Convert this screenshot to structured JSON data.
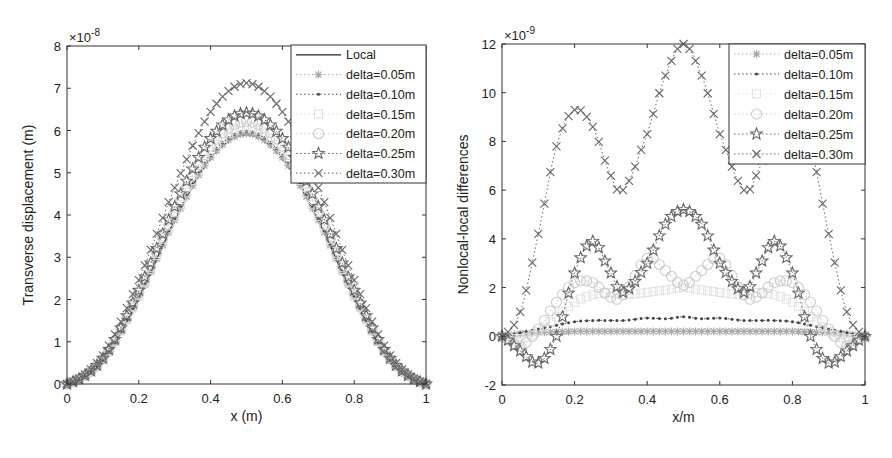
{
  "chart_data": [
    {
      "type": "line",
      "title": "",
      "xlabel": "x (m)",
      "ylabel": "Transverse displacement (m)",
      "y_multiplier": "×10",
      "y_exponent": "-8",
      "xlim": [
        0,
        1
      ],
      "ylim": [
        0,
        8
      ],
      "xticks": [
        "0",
        "0.2",
        "0.4",
        "0.6",
        "0.8",
        "1"
      ],
      "yticks": [
        "0",
        "1",
        "2",
        "3",
        "4",
        "5",
        "6",
        "7",
        "8"
      ],
      "grid": false,
      "legend_position": "upper right",
      "x_note": "curves are sin^2-shaped, zero at ends, peak at x=0.5; values given at peak",
      "x": [
        0,
        0.1,
        0.2,
        0.3,
        0.4,
        0.5,
        0.6,
        0.7,
        0.8,
        0.9,
        1.0
      ],
      "series": [
        {
          "name": "Local",
          "marker": "none",
          "line": "solid",
          "color": "#222222",
          "peak": 5.9,
          "values": [
            0,
            0.56,
            2.04,
            3.86,
            5.34,
            5.9,
            5.34,
            3.86,
            2.04,
            0.56,
            0
          ]
        },
        {
          "name": "delta=0.05m",
          "marker": "asterisk",
          "line": "dotted",
          "color": "#aaaaaa",
          "peak": 5.93,
          "values": [
            0,
            0.57,
            2.05,
            3.88,
            5.36,
            5.93,
            5.36,
            3.88,
            2.05,
            0.57,
            0
          ]
        },
        {
          "name": "delta=0.10m",
          "marker": "dot",
          "line": "dotted",
          "color": "#444444",
          "peak": 5.98,
          "values": [
            0,
            0.57,
            2.07,
            3.91,
            5.41,
            5.98,
            5.41,
            3.91,
            2.07,
            0.57,
            0
          ]
        },
        {
          "name": "delta=0.15m",
          "marker": "square",
          "line": "dotted",
          "color": "#dddddd",
          "peak": 6.08,
          "values": [
            0,
            0.58,
            2.1,
            3.97,
            5.5,
            6.08,
            5.5,
            3.97,
            2.1,
            0.58,
            0
          ]
        },
        {
          "name": "delta=0.20m",
          "marker": "circle",
          "line": "dotted",
          "color": "#cccccc",
          "peak": 6.22,
          "values": [
            0,
            0.59,
            2.15,
            4.07,
            5.63,
            6.22,
            5.63,
            4.07,
            2.15,
            0.59,
            0
          ]
        },
        {
          "name": "delta=0.25m",
          "marker": "star",
          "line": "dotted",
          "color": "#666666",
          "peak": 6.42,
          "values": [
            0,
            0.61,
            2.22,
            4.2,
            5.81,
            6.42,
            5.81,
            4.2,
            2.22,
            0.61,
            0
          ]
        },
        {
          "name": "delta=0.30m",
          "marker": "x",
          "line": "dotted",
          "color": "#666666",
          "peak": 7.12,
          "values": [
            0,
            0.68,
            2.46,
            4.65,
            6.44,
            7.12,
            6.44,
            4.65,
            2.46,
            0.68,
            0
          ]
        }
      ]
    },
    {
      "type": "line",
      "title": "",
      "xlabel": "x/m",
      "ylabel": "Nonlocal-local differences",
      "y_multiplier": "×10",
      "y_exponent": "-9",
      "xlim": [
        0,
        1
      ],
      "ylim": [
        -2,
        12
      ],
      "xticks": [
        "0",
        "0.2",
        "0.4",
        "0.6",
        "0.8",
        "1"
      ],
      "yticks": [
        "-2",
        "0",
        "2",
        "4",
        "6",
        "8",
        "10",
        "12"
      ],
      "grid": false,
      "legend_position": "upper right",
      "x": [
        0,
        0.05,
        0.1,
        0.15,
        0.2,
        0.25,
        0.3,
        0.333,
        0.4,
        0.45,
        0.5,
        0.55,
        0.6,
        0.667,
        0.7,
        0.75,
        0.8,
        0.85,
        0.9,
        0.95,
        1.0
      ],
      "series": [
        {
          "name": "delta=0.05m",
          "marker": "asterisk",
          "line": "dotted",
          "color": "#aaaaaa",
          "values": [
            0,
            0.1,
            0.15,
            0.18,
            0.2,
            0.2,
            0.2,
            0.2,
            0.2,
            0.2,
            0.2,
            0.2,
            0.2,
            0.2,
            0.2,
            0.2,
            0.2,
            0.18,
            0.15,
            0.1,
            0
          ]
        },
        {
          "name": "delta=0.10m",
          "marker": "dot",
          "line": "dotted",
          "color": "#444444",
          "values": [
            0,
            0.15,
            0.3,
            0.45,
            0.6,
            0.65,
            0.65,
            0.65,
            0.75,
            0.72,
            0.8,
            0.72,
            0.75,
            0.65,
            0.65,
            0.65,
            0.6,
            0.45,
            0.3,
            0.15,
            0
          ]
        },
        {
          "name": "delta=0.15m",
          "marker": "square",
          "line": "dotted",
          "color": "#e2e2e2",
          "values": [
            0,
            -0.1,
            0.2,
            0.8,
            1.4,
            1.7,
            1.8,
            1.7,
            1.8,
            1.9,
            2.0,
            1.9,
            1.8,
            1.7,
            1.8,
            1.7,
            1.4,
            0.8,
            0.2,
            -0.1,
            0
          ]
        },
        {
          "name": "delta=0.20m",
          "marker": "circle",
          "line": "dotted",
          "color": "#cccccc",
          "values": [
            0,
            -0.4,
            0.3,
            1.4,
            2.2,
            2.2,
            1.6,
            1.7,
            3.2,
            2.7,
            2.1,
            2.7,
            3.2,
            1.7,
            1.6,
            2.2,
            2.2,
            1.4,
            0.3,
            -0.4,
            0
          ]
        },
        {
          "name": "delta=0.25m",
          "marker": "star",
          "line": "dotted",
          "color": "#666666",
          "values": [
            0,
            -0.6,
            -1.1,
            0.0,
            2.6,
            3.9,
            2.6,
            1.8,
            3.0,
            4.6,
            5.2,
            4.6,
            3.0,
            1.8,
            2.6,
            3.9,
            2.6,
            0.0,
            -1.1,
            -0.6,
            0
          ]
        },
        {
          "name": "delta=0.30m",
          "marker": "x",
          "line": "dotted",
          "color": "#666666",
          "values": [
            0,
            1.0,
            4.2,
            7.8,
            9.3,
            8.6,
            6.6,
            6.0,
            8.3,
            10.7,
            12.0,
            10.7,
            8.3,
            6.0,
            6.6,
            8.6,
            9.3,
            7.8,
            4.2,
            1.0,
            0
          ]
        }
      ]
    }
  ],
  "charts": {
    "left": {
      "xlabel": "x (m)",
      "ylabel": "Transverse displacement (m)",
      "multiplier": "×10",
      "exponent": "-8"
    },
    "right": {
      "xlabel": "x/m",
      "ylabel": "Nonlocal-local differences",
      "multiplier": "×10",
      "exponent": "-9"
    }
  }
}
